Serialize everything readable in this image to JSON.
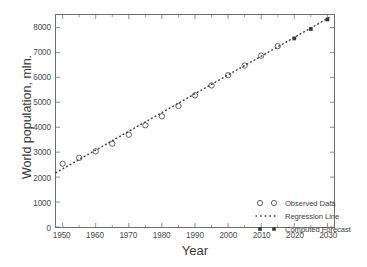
{
  "chart_data": {
    "type": "scatter",
    "title": "",
    "xlabel": "Year",
    "ylabel": "World population, mln.",
    "xlim": [
      1948,
      2032
    ],
    "ylim": [
      0,
      8500
    ],
    "grid": false,
    "legend_position": "inside-lower-right",
    "xticks": [
      1950,
      1960,
      1970,
      1980,
      1990,
      2000,
      2010,
      2020,
      2030
    ],
    "xtick_labels": [
      "1950",
      "1960",
      "1970",
      "1980",
      "1990",
      "2000",
      "2010",
      "2020",
      "2030"
    ],
    "yticks": [
      0,
      1000,
      2000,
      3000,
      4000,
      5000,
      6000,
      7000,
      8000
    ],
    "ytick_labels": [
      "0",
      "1000",
      "2000",
      "3000",
      "4000",
      "5000",
      "6000",
      "7000",
      "8000"
    ],
    "series": [
      {
        "name": "Observed Data",
        "marker": "open-circle",
        "color": "#4d4d4d",
        "x": [
          1950,
          1955,
          1960,
          1965,
          1970,
          1975,
          1980,
          1985,
          1990,
          1995,
          2000,
          2005,
          2010,
          2015
        ],
        "values": [
          2536,
          2773,
          3035,
          3340,
          3700,
          4079,
          4440,
          4853,
          5280,
          5674,
          6085,
          6473,
          6870,
          7250
        ]
      },
      {
        "name": "Regression Line",
        "marker": "dotted-line",
        "color": "#3a3a3a",
        "x": [
          1948,
          2031
        ],
        "values": [
          2180,
          8430
        ]
      },
      {
        "name": "Computed Forecast",
        "marker": "filled-square",
        "color": "#3a3a3a",
        "x": [
          2020,
          2025,
          2030
        ],
        "values": [
          7560,
          7940,
          8320
        ]
      }
    ],
    "legend_entries": [
      {
        "label": "Observed Data",
        "marker": "open-circle"
      },
      {
        "label": "Regression Line",
        "marker": "dotted-line"
      },
      {
        "label": "Computed Forecast",
        "marker": "filled-square"
      }
    ]
  },
  "colors": {
    "axis": "#6e6e6e",
    "tick_text": "#4a4a4a",
    "axis_title": "#3a3a3a",
    "data": "#4d4d4d",
    "background": "#ffffff"
  }
}
